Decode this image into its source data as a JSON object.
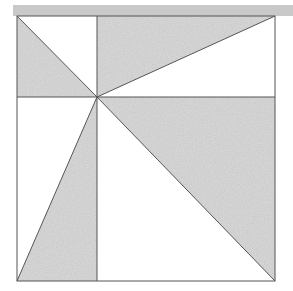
{
  "diagram": {
    "colors": {
      "background": "#ffffff",
      "top_bar": "#c9c9c9",
      "shade": "#d6d6d6",
      "line": "#555555"
    },
    "square": {
      "x1": 17,
      "y1": 16,
      "x2": 275,
      "y2": 281
    },
    "center_point": {
      "x": 97,
      "y": 97
    },
    "shaded_triangles": [
      {
        "name": "top-left",
        "points": "17,16 17,97 97,97"
      },
      {
        "name": "top-right",
        "points": "97,16 275,16 97,97"
      },
      {
        "name": "bottom-right",
        "points": "97,97 275,97 275,281"
      },
      {
        "name": "bottom-left",
        "points": "97,97 17,281 97,281"
      }
    ]
  }
}
